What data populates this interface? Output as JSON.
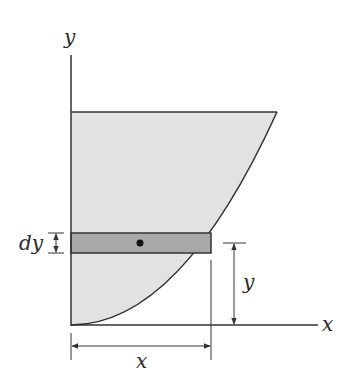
{
  "diagram": {
    "colors": {
      "region_fill": "#e2e2e2",
      "strip_fill": "#a8a8a8",
      "line": "#333333",
      "background": "#ffffff"
    },
    "labels": {
      "y_axis": "y",
      "x_axis": "x",
      "strip_thickness": "dy",
      "strip_height": "y",
      "strip_length": "x"
    },
    "geometry": {
      "origin": [
        71,
        325
      ],
      "top_edge_y": 112,
      "top_right_x": 277,
      "strip_top": 233,
      "strip_bottom": 253,
      "strip_right": 211,
      "centroid": [
        140,
        243
      ]
    }
  }
}
